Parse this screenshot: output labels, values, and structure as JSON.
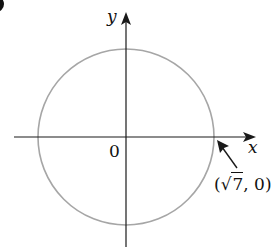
{
  "figure": {
    "panel_label": "b",
    "axes": {
      "x_label": "x",
      "y_label": "y",
      "origin_label": "0"
    },
    "circle": {
      "center": [
        0,
        0
      ],
      "radius_label": "√7",
      "stroke_color": "#a6a6a6"
    },
    "annotation": {
      "point_text_open": "(",
      "point_sqrt_symbol": "√",
      "point_sqrt_value": "7",
      "point_text_close": ", 0)",
      "points_to": [
        2.6458,
        0
      ]
    },
    "colors": {
      "axis": "#1a1a1a",
      "circle": "#a6a6a6",
      "text": "#111111",
      "background": "#ffffff"
    }
  }
}
